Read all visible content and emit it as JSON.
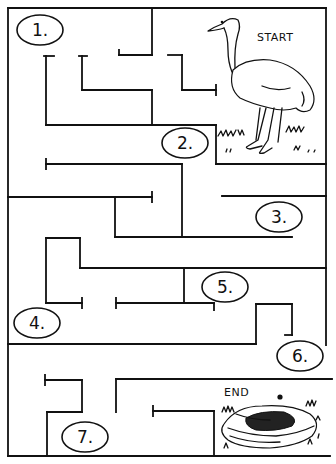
{
  "puzzle": {
    "type": "maze",
    "start_label": "START",
    "end_label": "END",
    "checkpoints": [
      {
        "id": 1,
        "label": "1.",
        "cx": 40,
        "cy": 30
      },
      {
        "id": 2,
        "label": "2.",
        "cx": 88,
        "cy": 55
      },
      {
        "id": 3,
        "label": "3.",
        "cx": 280,
        "cy": 70
      },
      {
        "id": 4,
        "label": "4.",
        "cx": 38,
        "cy": 327
      },
      {
        "id": 5,
        "label": "5.",
        "cx": 225,
        "cy": 287
      },
      {
        "id": 6,
        "label": "6.",
        "cx": 300,
        "cy": 355
      },
      {
        "id": 7,
        "label": "7.",
        "cx": 85,
        "cy": 437
      }
    ],
    "start_art": "ostrich",
    "end_art": "nest-with-egg"
  }
}
